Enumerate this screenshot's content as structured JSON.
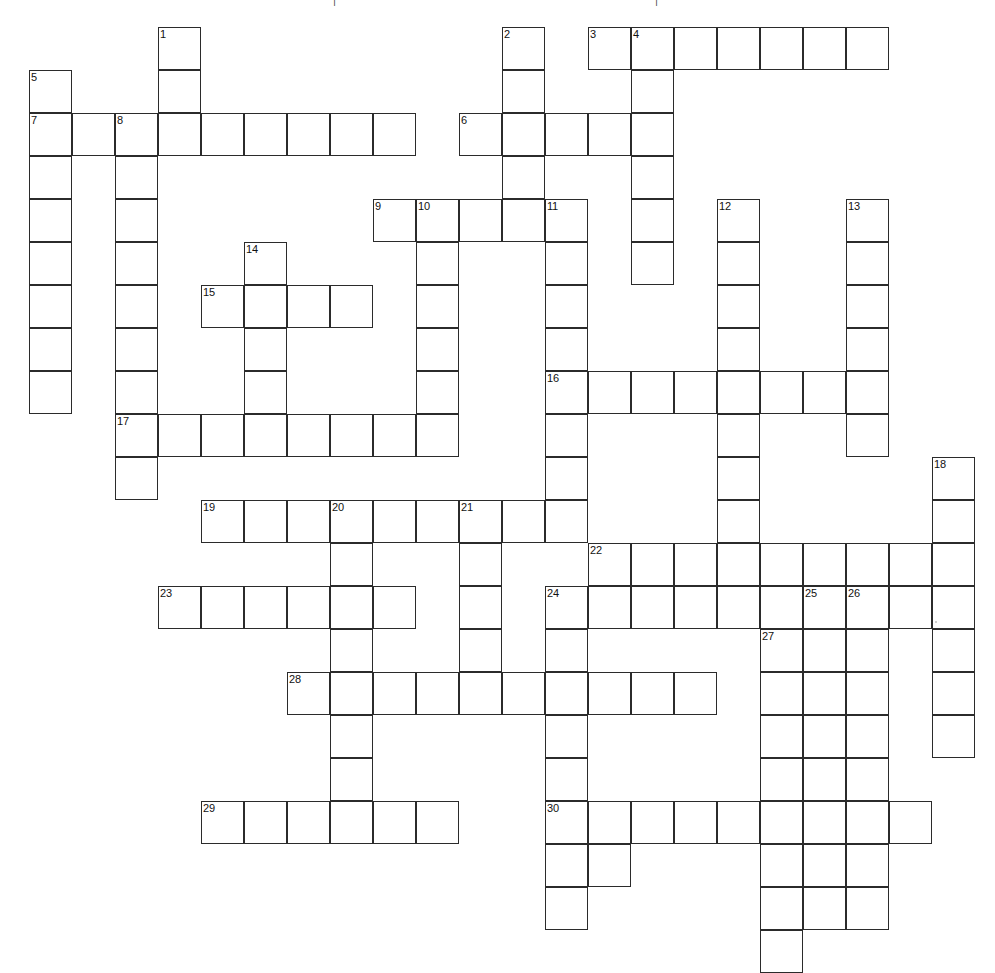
{
  "puzzle": {
    "title": "Crossword Puzzle Grid",
    "cell_size": 43,
    "origin_x": 29,
    "origin_y": 27,
    "columns": 22,
    "rows": 22,
    "line_color": "#2b2b2b",
    "cell_fill": "#ffffff",
    "page_background": "#ffffff",
    "number_font_size": "11px",
    "clue_count": 30,
    "top_partial_marks": [
      "|",
      "|"
    ]
  },
  "entries": [
    {
      "number": 1,
      "direction": "down",
      "col": 3,
      "row": 0,
      "length": 3
    },
    {
      "number": 2,
      "direction": "down",
      "col": 11,
      "row": 0,
      "length": 4
    },
    {
      "number": 3,
      "direction": "across",
      "col": 13,
      "row": 0,
      "length": 7
    },
    {
      "number": 4,
      "direction": "down",
      "col": 14,
      "row": 0,
      "length": 6
    },
    {
      "number": 5,
      "direction": "down",
      "col": 0,
      "row": 1,
      "length": 8
    },
    {
      "number": 6,
      "direction": "across",
      "col": 10,
      "row": 2,
      "length": 4
    },
    {
      "number": 7,
      "direction": "across",
      "col": 0,
      "row": 2,
      "length": 9
    },
    {
      "number": 8,
      "direction": "down",
      "col": 2,
      "row": 2,
      "length": 9
    },
    {
      "number": 9,
      "direction": "across",
      "col": 8,
      "row": 4,
      "length": 5
    },
    {
      "number": 10,
      "direction": "down",
      "col": 9,
      "row": 4,
      "length": 5
    },
    {
      "number": 11,
      "direction": "down",
      "col": 12,
      "row": 4,
      "length": 8
    },
    {
      "number": 12,
      "direction": "down",
      "col": 16,
      "row": 4,
      "length": 9
    },
    {
      "number": 13,
      "direction": "down",
      "col": 19,
      "row": 4,
      "length": 6
    },
    {
      "number": 14,
      "direction": "down",
      "col": 5,
      "row": 5,
      "length": 5
    },
    {
      "number": 15,
      "direction": "across",
      "col": 4,
      "row": 6,
      "length": 4
    },
    {
      "number": 16,
      "direction": "across",
      "col": 12,
      "row": 8,
      "length": 8
    },
    {
      "number": 17,
      "direction": "across",
      "col": 2,
      "row": 9,
      "length": 8
    },
    {
      "number": 18,
      "direction": "down",
      "col": 21,
      "row": 10,
      "length": 7
    },
    {
      "number": 19,
      "direction": "across",
      "col": 4,
      "row": 11,
      "length": 8
    },
    {
      "number": 20,
      "direction": "down",
      "col": 7,
      "row": 11,
      "length": 7
    },
    {
      "number": 21,
      "direction": "down",
      "col": 10,
      "row": 11,
      "length": 4
    },
    {
      "number": 22,
      "direction": "across",
      "col": 13,
      "row": 12,
      "length": 5
    },
    {
      "number": 23,
      "direction": "across",
      "col": 3,
      "row": 13,
      "length": 6
    },
    {
      "number": 24,
      "direction": "down",
      "col": 12,
      "row": 13,
      "length": 8
    },
    {
      "number": 25,
      "direction": "down",
      "col": 18,
      "row": 13,
      "length": 8
    },
    {
      "number": 26,
      "direction": "down",
      "col": 19,
      "row": 13,
      "length": 8
    },
    {
      "number": 27,
      "direction": "down",
      "col": 17,
      "row": 14,
      "length": 8
    },
    {
      "number": 28,
      "direction": "across",
      "col": 6,
      "row": 15,
      "length": 10
    },
    {
      "number": 29,
      "direction": "across",
      "col": 4,
      "row": 18,
      "length": 6
    },
    {
      "number": 30,
      "direction": "across",
      "col": 12,
      "row": 18,
      "length": 9
    }
  ],
  "extra_cells": [
    {
      "col": 3,
      "row": 1
    },
    {
      "col": 3,
      "row": 2
    },
    {
      "col": 1,
      "row": 2
    },
    {
      "col": 4,
      "row": 2
    },
    {
      "col": 5,
      "row": 2
    },
    {
      "col": 6,
      "row": 2
    },
    {
      "col": 7,
      "row": 2
    },
    {
      "col": 8,
      "row": 2
    },
    {
      "col": 12,
      "row": 9
    },
    {
      "col": 18,
      "row": 12
    },
    {
      "col": 19,
      "row": 12
    },
    {
      "col": 20,
      "row": 12
    },
    {
      "col": 13,
      "row": 13
    },
    {
      "col": 14,
      "row": 13
    },
    {
      "col": 15,
      "row": 13
    },
    {
      "col": 16,
      "row": 13
    },
    {
      "col": 17,
      "row": 13
    },
    {
      "col": 20,
      "row": 13
    },
    {
      "col": 13,
      "row": 19
    }
  ],
  "numbers_visible": [
    "1",
    "2",
    "3",
    "4",
    "5",
    "6",
    "7",
    "8",
    "9",
    "10",
    "11",
    "12",
    "13",
    "14",
    "15",
    "16",
    "17",
    "18",
    "19",
    "20",
    "21",
    "22",
    "23",
    "24",
    "25",
    "26",
    "27",
    "28",
    "29",
    "30"
  ]
}
